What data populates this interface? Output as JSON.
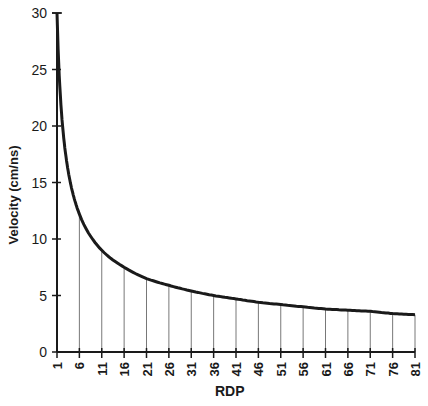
{
  "chart_data": {
    "type": "line",
    "title": "",
    "xlabel": "RDP",
    "ylabel": "Velocity (cm/ns)",
    "x": [
      1,
      6,
      11,
      16,
      21,
      26,
      31,
      36,
      41,
      46,
      51,
      56,
      61,
      66,
      71,
      76,
      81
    ],
    "series": [
      {
        "name": "Velocity",
        "values": [
          30.0,
          12.2,
          9.0,
          7.5,
          6.5,
          5.9,
          5.4,
          5.0,
          4.7,
          4.4,
          4.2,
          4.0,
          3.8,
          3.7,
          3.6,
          3.4,
          3.3
        ]
      }
    ],
    "xticks": [
      "1",
      "6",
      "11",
      "16",
      "21",
      "26",
      "31",
      "36",
      "41",
      "46",
      "51",
      "56",
      "61",
      "66",
      "71",
      "76",
      "81"
    ],
    "yticks": [
      "0",
      "5",
      "10",
      "15",
      "20",
      "25",
      "30"
    ],
    "ylim": [
      0,
      30
    ],
    "xlim": [
      1,
      81
    ],
    "grid": false,
    "drop_lines": true,
    "legend": null,
    "colors": {
      "curve": "#1a1a1a",
      "axis": "#1a1a1a",
      "drop_line": "#555555"
    }
  }
}
